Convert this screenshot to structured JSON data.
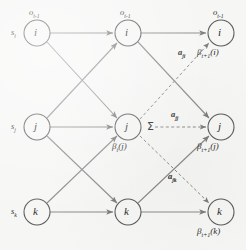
{
  "figure": {
    "type": "hmm-backward-trellis-diagram",
    "background_color": "#f6f6f5",
    "node_stroke_color": "#5b5b5b",
    "edge_color": "#8a8a8a",
    "text_color": "#2b2b2b"
  },
  "columns": [
    {
      "id": "left",
      "observation_label": "o",
      "observation_sub": "t-1",
      "nodes": [
        {
          "id": "left-i",
          "label": "i",
          "state_label": "s",
          "state_sub": "i",
          "obs_label": "o",
          "obs_sub": "t-1"
        },
        {
          "id": "left-j",
          "label": "j",
          "state_label": "s",
          "state_sub": "j"
        },
        {
          "id": "left-k",
          "label": "k",
          "state_label": "s",
          "state_sub": "k"
        }
      ]
    },
    {
      "id": "middle",
      "nodes": [
        {
          "id": "mid-i",
          "label": "i",
          "obs_label": "o",
          "obs_sub": "t-1"
        },
        {
          "id": "mid-j",
          "label": "j",
          "beta": "β",
          "beta_sub": "t",
          "beta_arg": "(j)"
        },
        {
          "id": "mid-k",
          "label": "k"
        }
      ]
    },
    {
      "id": "right",
      "nodes": [
        {
          "id": "right-i",
          "label": "i",
          "obs_label": "o",
          "obs_sub": "t-1",
          "beta": "β",
          "beta_sub": "t+1",
          "beta_arg": "(i)"
        },
        {
          "id": "right-j",
          "label": "j",
          "beta": "β",
          "beta_sub": "t+1",
          "beta_arg": "(j)"
        },
        {
          "id": "right-k",
          "label": "k",
          "beta": "β",
          "beta_sub": "t+1",
          "beta_arg": "(k)"
        }
      ]
    }
  ],
  "labels": {
    "obs_top_left": "o",
    "obs_top_left_sub": "t-1",
    "obs_top_mid": "o",
    "obs_top_mid_sub": "t-1",
    "obs_top_right": "o",
    "obs_top_right_sub": "t-1",
    "state_i": "s",
    "state_i_sub": "i",
    "state_j": "s",
    "state_j_sub": "j",
    "state_k": "s",
    "state_k_sub": "k",
    "node_i_left": "i",
    "node_j_left": "j",
    "node_k_left": "k",
    "node_i_mid": "i",
    "node_j_mid": "j",
    "node_k_mid": "k",
    "node_i_right": "i",
    "node_j_right": "j",
    "node_k_right": "k",
    "beta_mid_j": "β",
    "beta_mid_j_sub": "t",
    "beta_mid_j_arg": "(j)",
    "beta_right_i": "β",
    "beta_right_i_sub": "t+1",
    "beta_right_i_arg": "(i)",
    "beta_right_j": "β",
    "beta_right_j_sub": "t+1",
    "beta_right_j_arg": "(j)",
    "beta_right_k": "β",
    "beta_right_k_sub": "t+1",
    "beta_right_k_arg": "(k)",
    "transition_ji": "a",
    "transition_ji_sub": "ji",
    "transition_jj": "a",
    "transition_jj_sub": "jj",
    "transition_jk": "a",
    "transition_jk_sub": "jk",
    "summation": "Σ"
  }
}
